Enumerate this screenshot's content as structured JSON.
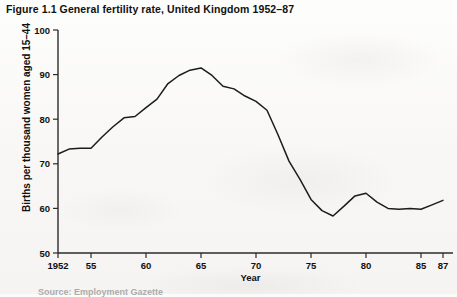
{
  "figure": {
    "title": "Figure 1.1 General fertility rate, United Kingdom 1952–87",
    "source_note": "Source: Employment Gazette"
  },
  "chart_data": {
    "type": "line",
    "title": "Figure 1.1 General fertility rate, United Kingdom 1952–87",
    "xlabel": "Year",
    "ylabel": "Births per thousand women aged 15–44",
    "xlim": [
      1952,
      1987
    ],
    "ylim": [
      50,
      100
    ],
    "grid": false,
    "legend": null,
    "y_ticks": [
      50,
      60,
      70,
      80,
      90,
      100
    ],
    "y_tick_labels": [
      "50",
      "60",
      "70",
      "80",
      "90",
      "100"
    ],
    "x_ticks": [
      1952,
      1955,
      1960,
      1965,
      1970,
      1975,
      1980,
      1985,
      1987
    ],
    "x_tick_labels": [
      "1952",
      "55",
      "60",
      "65",
      "70",
      "75",
      "80",
      "85",
      "87"
    ],
    "series": [
      {
        "name": "General fertility rate",
        "x": [
          1952,
          1953,
          1954,
          1955,
          1956,
          1957,
          1958,
          1959,
          1960,
          1961,
          1962,
          1963,
          1964,
          1965,
          1966,
          1967,
          1968,
          1969,
          1970,
          1971,
          1972,
          1973,
          1974,
          1975,
          1976,
          1977,
          1978,
          1979,
          1980,
          1981,
          1982,
          1983,
          1984,
          1985,
          1986,
          1987
        ],
        "y": [
          72.2,
          73.3,
          73.5,
          73.5,
          76.0,
          78.3,
          80.3,
          80.6,
          82.6,
          84.5,
          88.0,
          89.8,
          91.0,
          91.5,
          89.8,
          87.4,
          86.8,
          85.2,
          84.0,
          82.0,
          76.5,
          70.6,
          66.5,
          62.0,
          59.5,
          58.3,
          60.5,
          62.8,
          63.4,
          61.4,
          60.0,
          59.8,
          60.0,
          59.8,
          60.8,
          61.8
        ]
      }
    ],
    "annotations": {
      "peak_year": 1965,
      "peak_value": 91.5,
      "trough_year": 1977,
      "trough_value": 58.3
    }
  }
}
